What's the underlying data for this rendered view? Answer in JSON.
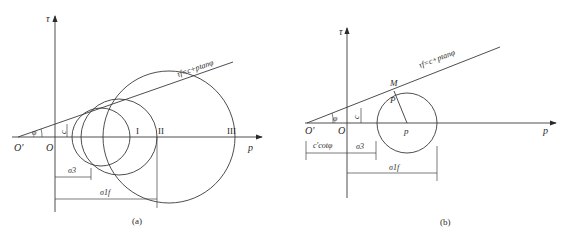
{
  "panel_a": {
    "caption": "(a)",
    "tau_label": "τ",
    "p_label": "p",
    "origin_label": "O",
    "origin_prime_label": "O'",
    "phi_label": "φ",
    "c_label": "c",
    "envelope_label": "τf=c+ptanφ",
    "circle_labels": [
      "I",
      "II",
      "III"
    ],
    "sigma3_label": "σ3",
    "sigma1f_label": "σ1f"
  },
  "panel_b": {
    "caption": "(b)",
    "tau_label": "τ",
    "p_label": "p",
    "origin_label": "O",
    "origin_prime_label": "O'",
    "phi_label": "φ",
    "c_label": "c",
    "envelope_label": "τf=c+ptanφ",
    "tangent_point_label": "M",
    "radius_label": "P",
    "center_label": "p",
    "ccot_label": "c'cotφ",
    "sigma3_label": "σ3",
    "sigma1f_label": "σ1f"
  }
}
